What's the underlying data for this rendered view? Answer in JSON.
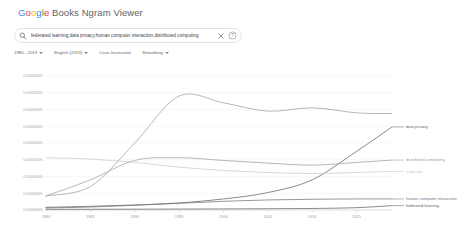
{
  "header": {
    "logo_google": "Google",
    "logo_rest": " Books Ngram Viewer"
  },
  "search": {
    "icon": "search-icon",
    "query": "federated learning,data privacy,human computer interaction,distributed computing",
    "clear_icon": "close-icon",
    "help_icon": "help-circle-icon"
  },
  "controls": [
    {
      "label": "1980 - 2019",
      "has_caret": true
    },
    {
      "label": "English (2019)",
      "has_caret": true
    },
    {
      "label": "Case-Insensitive",
      "has_caret": false
    },
    {
      "label": "Smoothing",
      "has_caret": true
    }
  ],
  "chart_data": {
    "type": "line",
    "title": "",
    "xlabel": "",
    "ylabel": "",
    "grid": true,
    "legend_position": "right-inline",
    "xlim": [
      1980,
      2019
    ],
    "ylim": [
      0,
      0.0004
    ],
    "xticks": [
      "1980",
      "1985",
      "1990",
      "1995",
      "2000",
      "2005",
      "2010",
      "2015"
    ],
    "xtick_values": [
      1980,
      1985,
      1990,
      1995,
      2000,
      2005,
      2010,
      2015
    ],
    "yticks": [
      "0.0004000%",
      "0.0003500%",
      "0.0003000%",
      "0.0002500%",
      "0.0002000%",
      "0.0001500%",
      "0.0001000%",
      "0.0000500%",
      "0.0000000%"
    ],
    "ytick_values": [
      0.0004,
      0.00035,
      0.0003,
      0.00025,
      0.0002,
      0.00015,
      0.0001,
      5e-05,
      0.0
    ],
    "x": [
      1980,
      1985,
      1990,
      1995,
      2000,
      2005,
      2010,
      2015,
      2019
    ],
    "series": [
      {
        "name": "data privacy",
        "color": "#5f6368",
        "label": "data privacy",
        "values": [
          8e-06,
          1.1e-05,
          1.5e-05,
          2.1e-05,
          3.3e-05,
          5.2e-05,
          9e-05,
          0.000175,
          0.000248
        ]
      },
      {
        "name": "distributed computing",
        "color": "#9aa0a6",
        "label": "distributed computing",
        "values": [
          4.2e-05,
          9e-05,
          0.000148,
          0.000156,
          0.000148,
          0.00014,
          0.000134,
          0.000142,
          0.000149
        ]
      },
      {
        "name": "ui design",
        "color": "#c8cbcf",
        "label": "ui design",
        "values": [
          0.000156,
          0.000152,
          0.000142,
          0.000128,
          0.000118,
          0.000112,
          0.000109,
          0.000112,
          0.000115
        ]
      },
      {
        "name": "human computer interaction",
        "color": "#70757a",
        "label": "human computer interaction",
        "values": [
          6e-06,
          9e-06,
          1.4e-05,
          2e-05,
          2.6e-05,
          3e-05,
          3.2e-05,
          3.3e-05,
          3.3e-05
        ]
      },
      {
        "name": "federated learning",
        "color": "#5f6368",
        "label": "federated learning",
        "values": [
          2e-06,
          2.2e-06,
          2.5e-06,
          2.8e-06,
          3.2e-06,
          3.8e-06,
          4.5e-06,
          7e-06,
          1.3e-05
        ]
      },
      {
        "name": "peak-curve",
        "color": "#9aa0a6",
        "label": "",
        "values": [
          4.2e-05,
          7e-05,
          0.0002,
          0.00034,
          0.00032,
          0.000295,
          0.000305,
          0.00029,
          0.000288
        ]
      }
    ]
  }
}
